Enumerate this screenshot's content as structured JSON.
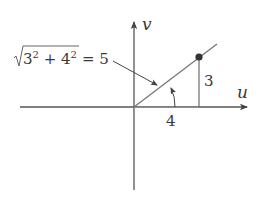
{
  "figure": {
    "axes": {
      "horizontal_label": "u",
      "vertical_label": "v"
    },
    "triangle": {
      "horizontal_leg_label": "4",
      "vertical_leg_label": "3",
      "point": {
        "u": 4,
        "v": 3
      }
    },
    "hypotenuse_annotation": {
      "radicand": "3² + 4²",
      "equals": "= 5",
      "full_text": "√(3² + 4²) = 5"
    },
    "angle_marker": "arc from u-axis to hypotenuse"
  }
}
